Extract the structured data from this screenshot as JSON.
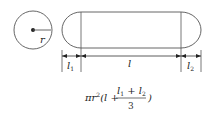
{
  "diagram": {
    "circle": {
      "radius_label": "r"
    },
    "capsule": {
      "left_cap_label": "l",
      "left_cap_sub": "1",
      "body_label": "l",
      "right_cap_label": "l",
      "right_cap_sub": "2"
    },
    "formula": {
      "prefix": "πr",
      "exp": "2",
      "open": "(l + ",
      "num_a": "l",
      "num_a_sub": "1",
      "plus": " + ",
      "num_b": "l",
      "num_b_sub": "2",
      "denominator": "3",
      "close": ")"
    }
  }
}
